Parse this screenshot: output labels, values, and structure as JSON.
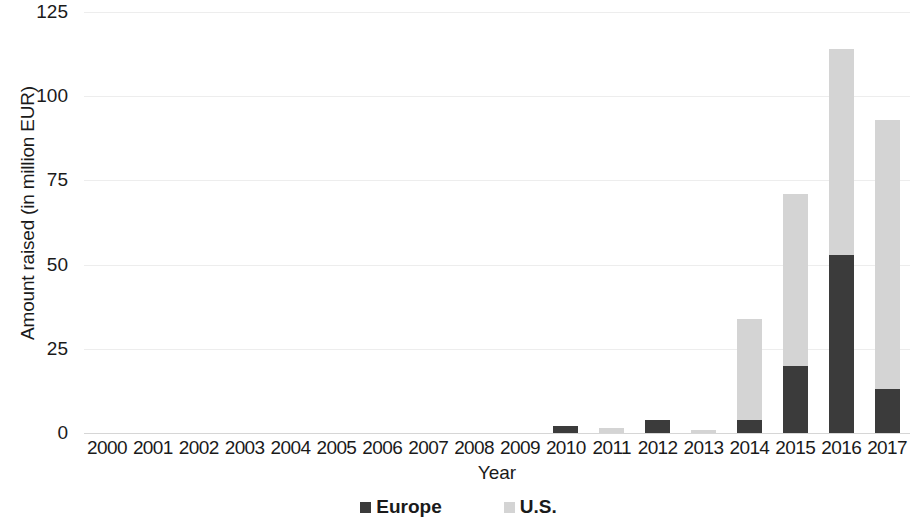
{
  "chart_data": {
    "type": "bar",
    "subtype": "stacked-vertical",
    "title": "",
    "xlabel": "Year",
    "ylabel": "Amount raised (in million EUR)",
    "categories": [
      "2000",
      "2001",
      "2002",
      "2003",
      "2004",
      "2005",
      "2006",
      "2007",
      "2008",
      "2009",
      "2010",
      "2011",
      "2012",
      "2013",
      "2014",
      "2015",
      "2016",
      "2017"
    ],
    "series": [
      {
        "name": "Europe",
        "color": "#3b3b3b",
        "values": [
          0,
          0,
          0,
          0,
          0,
          0,
          0,
          0,
          0,
          0,
          2,
          0,
          4,
          0,
          4,
          20,
          53,
          13
        ]
      },
      {
        "name": "U.S.",
        "color": "#d4d4d4",
        "values": [
          0,
          0,
          0,
          0,
          0,
          0,
          0,
          0,
          0,
          0,
          0,
          1.5,
          0,
          1,
          30,
          51,
          61,
          80
        ]
      }
    ],
    "totals": [
      0,
      0,
      0,
      0,
      0,
      0,
      0,
      0,
      0,
      0,
      2,
      1.5,
      4,
      1,
      34,
      71,
      114,
      93
    ],
    "ylim": [
      0,
      125
    ],
    "yticks": [
      0,
      25,
      50,
      75,
      100,
      125
    ],
    "ytick_labels": [
      "0",
      "25",
      "50",
      "75",
      "100",
      "125"
    ],
    "grid": true,
    "grid_axis": "y",
    "legend_position": "bottom",
    "legend": [
      {
        "label": "Europe",
        "color": "#3b3b3b"
      },
      {
        "label": "U.S.",
        "color": "#d4d4d4"
      }
    ]
  }
}
